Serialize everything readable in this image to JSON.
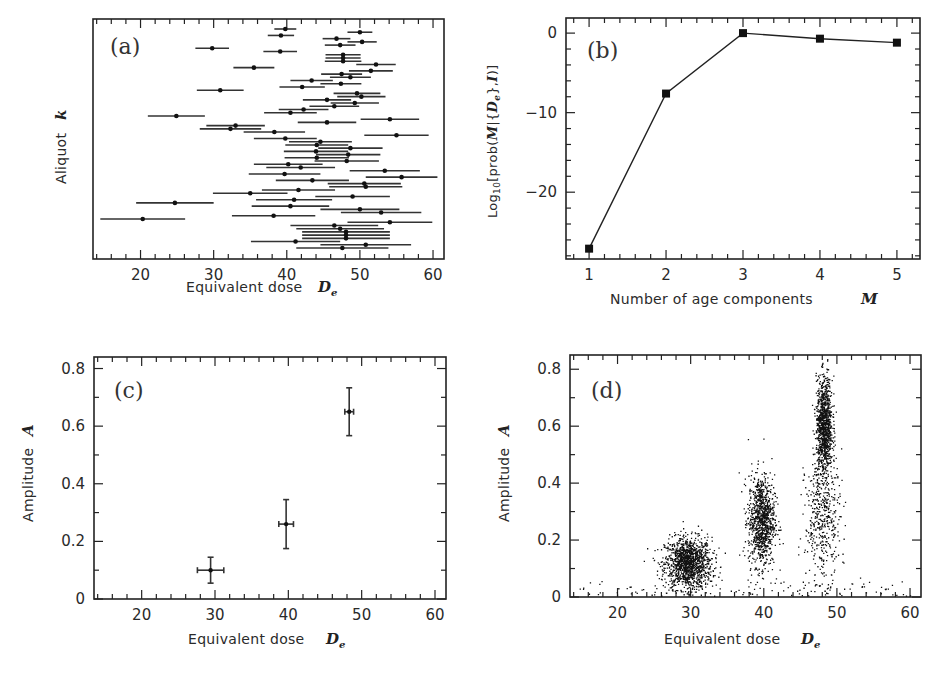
{
  "chart_data": [
    {
      "id": "a",
      "type": "scatter",
      "panel_label": "(a)",
      "title": "",
      "xlabel": "Equivalent dose",
      "xlabel_symbol": "De",
      "ylabel": "Aliquot",
      "ylabel_symbol": "k",
      "xlim": [
        13.5,
        61.5
      ],
      "xticks": [
        20,
        30,
        40,
        50,
        60
      ],
      "grid": false,
      "description": "Horizontal error bars: one per aliquot, point = De, bar = ±σ",
      "points": [
        {
          "x": 39.8,
          "err": 1.5
        },
        {
          "x": 50.0,
          "err": 1.7
        },
        {
          "x": 39.2,
          "err": 1.8
        },
        {
          "x": 46.8,
          "err": 1.9
        },
        {
          "x": 50.3,
          "err": 2.0
        },
        {
          "x": 47.3,
          "err": 2.1
        },
        {
          "x": 29.8,
          "err": 2.3
        },
        {
          "x": 39.1,
          "err": 2.3
        },
        {
          "x": 47.7,
          "err": 2.4
        },
        {
          "x": 47.7,
          "err": 2.4
        },
        {
          "x": 47.7,
          "err": 2.5
        },
        {
          "x": 52.2,
          "err": 2.7
        },
        {
          "x": 35.5,
          "err": 2.8
        },
        {
          "x": 51.5,
          "err": 3.0
        },
        {
          "x": 47.5,
          "err": 2.8
        },
        {
          "x": 48.7,
          "err": 2.8
        },
        {
          "x": 43.4,
          "err": 2.9
        },
        {
          "x": 47.4,
          "err": 2.8
        },
        {
          "x": 42.1,
          "err": 3.1
        },
        {
          "x": 30.9,
          "err": 3.2
        },
        {
          "x": 49.6,
          "err": 3.2
        },
        {
          "x": 50.2,
          "err": 3.3
        },
        {
          "x": 45.5,
          "err": 3.3
        },
        {
          "x": 49.3,
          "err": 3.3
        },
        {
          "x": 46.5,
          "err": 3.4
        },
        {
          "x": 42.3,
          "err": 3.4
        },
        {
          "x": 40.5,
          "err": 3.6
        },
        {
          "x": 24.9,
          "err": 3.9
        },
        {
          "x": 54.1,
          "err": 4.0
        },
        {
          "x": 45.5,
          "err": 4.0
        },
        {
          "x": 33.0,
          "err": 4.0
        },
        {
          "x": 32.3,
          "err": 4.2
        },
        {
          "x": 38.3,
          "err": 4.2
        },
        {
          "x": 55.0,
          "err": 4.4
        },
        {
          "x": 39.8,
          "err": 4.3
        },
        {
          "x": 44.6,
          "err": 4.3
        },
        {
          "x": 44.1,
          "err": 4.3
        },
        {
          "x": 48.7,
          "err": 4.4
        },
        {
          "x": 44.0,
          "err": 4.4
        },
        {
          "x": 48.4,
          "err": 4.4
        },
        {
          "x": 44.1,
          "err": 4.4
        },
        {
          "x": 48.2,
          "err": 4.4
        },
        {
          "x": 40.2,
          "err": 4.7
        },
        {
          "x": 41.9,
          "err": 4.7
        },
        {
          "x": 53.4,
          "err": 4.8
        },
        {
          "x": 39.7,
          "err": 4.9
        },
        {
          "x": 55.7,
          "err": 4.9
        },
        {
          "x": 43.5,
          "err": 5.0
        },
        {
          "x": 50.6,
          "err": 5.0
        },
        {
          "x": 50.8,
          "err": 5.0
        },
        {
          "x": 41.6,
          "err": 5.0
        },
        {
          "x": 35.0,
          "err": 5.1
        },
        {
          "x": 49.0,
          "err": 5.1
        },
        {
          "x": 41.0,
          "err": 5.2
        },
        {
          "x": 24.7,
          "err": 5.3
        },
        {
          "x": 40.5,
          "err": 5.3
        },
        {
          "x": 50.0,
          "err": 5.4
        },
        {
          "x": 52.9,
          "err": 5.5
        },
        {
          "x": 38.2,
          "err": 5.7
        },
        {
          "x": 20.3,
          "err": 5.8
        },
        {
          "x": 54.1,
          "err": 5.8
        },
        {
          "x": 46.5,
          "err": 6.0
        },
        {
          "x": 47.3,
          "err": 6.0
        },
        {
          "x": 48.1,
          "err": 6.0
        },
        {
          "x": 48.1,
          "err": 6.0
        },
        {
          "x": 48.1,
          "err": 6.0
        },
        {
          "x": 41.2,
          "err": 6.1
        },
        {
          "x": 50.8,
          "err": 6.2
        },
        {
          "x": 47.6,
          "err": 6.3
        }
      ]
    },
    {
      "id": "b",
      "type": "line",
      "panel_label": "(b)",
      "title": "",
      "xlabel": "Number of age components",
      "xlabel_symbol": "M",
      "ylabel": "Log10[prob(M|{De},I)]",
      "xlim": [
        0.7,
        5.3
      ],
      "ylim": [
        -28.4,
        1.9
      ],
      "xticks": [
        1,
        2,
        3,
        4,
        5
      ],
      "yticks": [
        0,
        -10,
        -20
      ],
      "ytick_labels": [
        "0",
        "−10",
        "−20"
      ],
      "grid": false,
      "marker": "square",
      "x": [
        1,
        2,
        3,
        4,
        5
      ],
      "values": [
        -27.1,
        -7.6,
        0.0,
        -0.7,
        -1.2
      ]
    },
    {
      "id": "c",
      "type": "scatter",
      "panel_label": "(c)",
      "title": "",
      "xlabel": "Equivalent dose",
      "xlabel_symbol": "De",
      "ylabel": "Amplitude",
      "ylabel_symbol": "A",
      "xlim": [
        13.5,
        61.5
      ],
      "ylim": [
        0,
        0.84
      ],
      "xticks": [
        20,
        30,
        40,
        50,
        60
      ],
      "yticks": [
        0,
        0.2,
        0.4,
        0.6,
        0.8
      ],
      "ytick_labels": [
        "0",
        "0.2",
        "0.4",
        "0.6",
        "0.8"
      ],
      "grid": false,
      "points": [
        {
          "x": 29.4,
          "y": 0.1,
          "xerr": 1.8,
          "yerr": 0.045
        },
        {
          "x": 39.7,
          "y": 0.26,
          "xerr": 1.0,
          "yerr": 0.085
        },
        {
          "x": 48.3,
          "y": 0.65,
          "xerr": 0.6,
          "yerr": 0.083
        }
      ]
    },
    {
      "id": "d",
      "type": "scatter",
      "panel_label": "(d)",
      "title": "",
      "xlabel": "Equivalent dose",
      "xlabel_symbol": "De",
      "ylabel": "Amplitude",
      "ylabel_symbol": "A",
      "xlim": [
        13.5,
        61.5
      ],
      "ylim": [
        0,
        0.85
      ],
      "xticks": [
        20,
        30,
        40,
        50,
        60
      ],
      "yticks": [
        0,
        0.2,
        0.4,
        0.6,
        0.8
      ],
      "ytick_labels": [
        "0",
        "0.2",
        "0.4",
        "0.6",
        "0.8"
      ],
      "grid": false,
      "description": "MCMC posterior samples: three clusters of (De, A)",
      "clusters": [
        {
          "cx": 29.6,
          "cy": 0.12,
          "sx": 1.6,
          "sy": 0.045,
          "n": 1300
        },
        {
          "cx": 39.6,
          "cy": 0.27,
          "sx": 0.9,
          "sy": 0.08,
          "n": 1000
        },
        {
          "cx": 48.2,
          "cy": 0.6,
          "sx": 0.55,
          "sy": 0.085,
          "n": 1000
        },
        {
          "cx": 48.0,
          "cy": 0.28,
          "sx": 1.2,
          "sy": 0.11,
          "n": 450
        }
      ],
      "background_points": 120
    }
  ],
  "labels": {
    "a": {
      "tag": "(a)",
      "x": "Equivalent dose",
      "x_sym": "D",
      "x_sub": "e",
      "y": "Aliquot",
      "y_sym": "k"
    },
    "b": {
      "tag": "(b)",
      "x": "Number of age components",
      "x_sym": "M",
      "y_pre": "Log",
      "y_sub": "10",
      "y_mid": "[prob(",
      "y_M": "M",
      "y_bar": "|{",
      "y_D": "D",
      "y_e": "e",
      "y_post": "},",
      "y_I": "I",
      "y_end": ")]"
    },
    "c": {
      "tag": "(c)",
      "x": "Equivalent dose",
      "x_sym": "D",
      "x_sub": "e",
      "y": "Amplitude",
      "y_sym": "A"
    },
    "d": {
      "tag": "(d)",
      "x": "Equivalent dose",
      "x_sym": "D",
      "x_sub": "e",
      "y": "Amplitude",
      "y_sym": "A"
    }
  }
}
